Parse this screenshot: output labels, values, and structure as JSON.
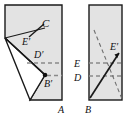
{
  "figure": {
    "type": "geometry-diagram",
    "background_color": "#ffffff",
    "shape_fill_color": "#e3e3e3",
    "stroke_color": "#1a1a1a",
    "dashed_color": "#8a8a8a",
    "panels": [
      {
        "id": "left-panel",
        "name": "folded-sheet-panel",
        "rect": {
          "x": 5,
          "y": 5,
          "width": 57,
          "height": 95
        },
        "labels": [
          {
            "key": "C",
            "text": "C",
            "x": 42,
            "y": 27
          },
          {
            "key": "Ep",
            "text": "E′",
            "x": 25,
            "y": 44
          },
          {
            "key": "Dp",
            "text": "D′",
            "x": 36,
            "y": 57
          },
          {
            "key": "Bp",
            "text": "B′",
            "x": 45,
            "y": 85
          },
          {
            "key": "A",
            "text": "A",
            "x": 60,
            "y": 110
          }
        ],
        "dashed_lines": [
          {
            "key": "d-line-Dp",
            "y": 63
          },
          {
            "key": "d-line-Bp",
            "y": 76
          }
        ],
        "marked_point": {
          "key": "Bp-dot",
          "x": 45,
          "y": 75
        }
      },
      {
        "id": "right-panel",
        "name": "unfolded-sheet-panel",
        "rect": {
          "x": 89,
          "y": 5,
          "width": 33,
          "height": 95
        },
        "labels": [
          {
            "key": "E",
            "text": "E",
            "x": 75,
            "y": 67
          },
          {
            "key": "D",
            "text": "D",
            "x": 75,
            "y": 81
          },
          {
            "key": "Ep",
            "text": "E′",
            "x": 113,
            "y": 53
          },
          {
            "key": "B",
            "text": "B",
            "x": 88,
            "y": 110
          }
        ],
        "dashed_lines": [
          {
            "key": "d-line-E",
            "y": 63
          },
          {
            "key": "d-line-D",
            "y": 76
          }
        ],
        "solid_diagonal": {
          "key": "crease-BE-prime",
          "x1": 91,
          "y1": 98,
          "x2": 120,
          "y2": 52
        },
        "dashed_diagonal": {
          "key": "fold-guide",
          "x1": 94,
          "y1": 30,
          "x2": 122,
          "y2": 99
        }
      }
    ]
  }
}
